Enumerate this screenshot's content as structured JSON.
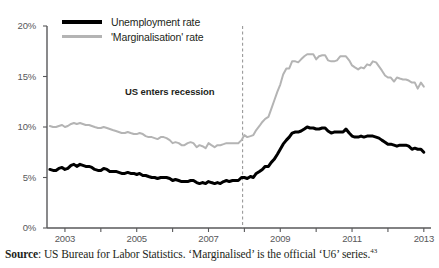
{
  "chart_data": {
    "type": "line",
    "title": "",
    "xlabel": "",
    "ylabel": "",
    "xlim": [
      2002.5,
      2013.2
    ],
    "ylim": [
      0,
      20
    ],
    "grid": false,
    "legend_position": "top-left",
    "y_tick_labels": [
      "20%",
      "15%",
      "10%",
      "5%",
      "0%"
    ],
    "y_tick_values": [
      20,
      15,
      10,
      5,
      0
    ],
    "x_tick_labels": [
      "2003",
      "2005",
      "2007",
      "2009",
      "2011",
      "2013"
    ],
    "x_tick_values": [
      2003,
      2005,
      2007,
      2009,
      2011,
      2013
    ],
    "annotations": [
      {
        "text": "US enters recession",
        "x": 2007.95,
        "type": "vertical-dashed-line"
      }
    ],
    "series": [
      {
        "name": "Unemployment rate",
        "color": "#000000",
        "width": 3,
        "x": [
          2002.58,
          2002.67,
          2002.75,
          2002.83,
          2002.92,
          2003.0,
          2003.08,
          2003.17,
          2003.25,
          2003.33,
          2003.42,
          2003.5,
          2003.58,
          2003.67,
          2003.75,
          2003.83,
          2003.92,
          2004.0,
          2004.08,
          2004.17,
          2004.25,
          2004.33,
          2004.42,
          2004.5,
          2004.58,
          2004.67,
          2004.75,
          2004.83,
          2004.92,
          2005.0,
          2005.08,
          2005.17,
          2005.25,
          2005.33,
          2005.42,
          2005.5,
          2005.58,
          2005.67,
          2005.75,
          2005.83,
          2005.92,
          2006.0,
          2006.08,
          2006.17,
          2006.25,
          2006.33,
          2006.42,
          2006.5,
          2006.58,
          2006.67,
          2006.75,
          2006.83,
          2006.92,
          2007.0,
          2007.08,
          2007.17,
          2007.25,
          2007.33,
          2007.42,
          2007.5,
          2007.58,
          2007.67,
          2007.75,
          2007.83,
          2007.92,
          2008.0,
          2008.08,
          2008.17,
          2008.25,
          2008.33,
          2008.42,
          2008.5,
          2008.58,
          2008.67,
          2008.75,
          2008.83,
          2008.92,
          2009.0,
          2009.08,
          2009.17,
          2009.25,
          2009.33,
          2009.42,
          2009.5,
          2009.58,
          2009.67,
          2009.75,
          2009.83,
          2009.92,
          2010.0,
          2010.08,
          2010.17,
          2010.25,
          2010.33,
          2010.42,
          2010.5,
          2010.58,
          2010.67,
          2010.75,
          2010.83,
          2010.92,
          2011.0,
          2011.08,
          2011.17,
          2011.25,
          2011.33,
          2011.42,
          2011.5,
          2011.58,
          2011.67,
          2011.75,
          2011.83,
          2011.92,
          2012.0,
          2012.08,
          2012.17,
          2012.25,
          2012.33,
          2012.42,
          2012.5,
          2012.58,
          2012.67,
          2012.75,
          2012.83,
          2012.92,
          2013.0
        ],
        "values": [
          5.8,
          5.7,
          5.7,
          5.9,
          6.0,
          5.8,
          5.9,
          6.2,
          6.3,
          6.1,
          6.3,
          6.2,
          6.1,
          6.1,
          6.0,
          5.8,
          5.7,
          5.7,
          5.9,
          5.8,
          5.6,
          5.6,
          5.6,
          5.5,
          5.4,
          5.4,
          5.5,
          5.4,
          5.4,
          5.3,
          5.4,
          5.2,
          5.2,
          5.1,
          5.0,
          5.0,
          4.9,
          5.0,
          5.0,
          5.0,
          4.9,
          4.7,
          4.8,
          4.7,
          4.6,
          4.6,
          4.6,
          4.7,
          4.7,
          4.5,
          4.4,
          4.5,
          4.4,
          4.6,
          4.5,
          4.4,
          4.5,
          4.4,
          4.6,
          4.7,
          4.6,
          4.7,
          4.7,
          4.7,
          5.0,
          5.0,
          4.9,
          5.1,
          5.0,
          5.4,
          5.6,
          5.8,
          6.1,
          6.1,
          6.5,
          6.8,
          7.3,
          7.8,
          8.3,
          8.7,
          9.0,
          9.4,
          9.5,
          9.5,
          9.6,
          9.8,
          10.0,
          9.9,
          9.9,
          9.8,
          9.8,
          9.9,
          9.9,
          9.6,
          9.4,
          9.5,
          9.5,
          9.5,
          9.5,
          9.8,
          9.4,
          9.1,
          9.0,
          9.0,
          9.1,
          9.0,
          9.1,
          9.1,
          9.1,
          9.0,
          8.9,
          8.7,
          8.5,
          8.3,
          8.3,
          8.2,
          8.1,
          8.2,
          8.2,
          8.2,
          8.1,
          7.8,
          7.9,
          7.8,
          7.8,
          7.5
        ]
      },
      {
        "name": "'Marginalisation' rate",
        "color": "#b4b4b4",
        "width": 2,
        "x": [
          2002.58,
          2002.67,
          2002.75,
          2002.83,
          2002.92,
          2003.0,
          2003.08,
          2003.17,
          2003.25,
          2003.33,
          2003.42,
          2003.5,
          2003.58,
          2003.67,
          2003.75,
          2003.83,
          2003.92,
          2004.0,
          2004.08,
          2004.17,
          2004.25,
          2004.33,
          2004.42,
          2004.5,
          2004.58,
          2004.67,
          2004.75,
          2004.83,
          2004.92,
          2005.0,
          2005.08,
          2005.17,
          2005.25,
          2005.33,
          2005.42,
          2005.5,
          2005.58,
          2005.67,
          2005.75,
          2005.83,
          2005.92,
          2006.0,
          2006.08,
          2006.17,
          2006.25,
          2006.33,
          2006.42,
          2006.5,
          2006.58,
          2006.67,
          2006.75,
          2006.83,
          2006.92,
          2007.0,
          2007.08,
          2007.17,
          2007.25,
          2007.33,
          2007.42,
          2007.5,
          2007.58,
          2007.67,
          2007.75,
          2007.83,
          2007.92,
          2008.0,
          2008.08,
          2008.17,
          2008.25,
          2008.33,
          2008.42,
          2008.5,
          2008.58,
          2008.67,
          2008.75,
          2008.83,
          2008.92,
          2009.0,
          2009.08,
          2009.17,
          2009.25,
          2009.33,
          2009.42,
          2009.5,
          2009.58,
          2009.67,
          2009.75,
          2009.83,
          2009.92,
          2010.0,
          2010.08,
          2010.17,
          2010.25,
          2010.33,
          2010.42,
          2010.5,
          2010.58,
          2010.67,
          2010.75,
          2010.83,
          2010.92,
          2011.0,
          2011.08,
          2011.17,
          2011.25,
          2011.33,
          2011.42,
          2011.5,
          2011.58,
          2011.67,
          2011.75,
          2011.83,
          2011.92,
          2012.0,
          2012.08,
          2012.17,
          2012.25,
          2012.33,
          2012.42,
          2012.5,
          2012.58,
          2012.67,
          2012.75,
          2012.83,
          2012.92,
          2013.0
        ],
        "values": [
          10.1,
          10.0,
          10.0,
          10.1,
          10.2,
          10.0,
          10.1,
          10.3,
          10.4,
          10.3,
          10.4,
          10.3,
          10.2,
          10.2,
          10.1,
          10.0,
          9.9,
          9.9,
          10.0,
          9.9,
          9.8,
          9.7,
          9.6,
          9.5,
          9.4,
          9.4,
          9.5,
          9.4,
          9.3,
          9.3,
          9.4,
          9.3,
          9.1,
          9.0,
          9.0,
          8.9,
          8.8,
          9.0,
          9.0,
          8.9,
          8.7,
          8.4,
          8.5,
          8.4,
          8.2,
          8.2,
          8.4,
          8.5,
          8.4,
          8.0,
          8.2,
          8.1,
          7.9,
          8.4,
          8.2,
          8.0,
          8.2,
          8.2,
          8.3,
          8.4,
          8.4,
          8.4,
          8.4,
          8.4,
          8.7,
          9.2,
          9.0,
          9.1,
          9.2,
          9.7,
          10.1,
          10.5,
          10.8,
          11.0,
          11.8,
          12.6,
          13.5,
          14.2,
          15.2,
          15.8,
          15.8,
          16.5,
          16.5,
          16.4,
          16.7,
          17.0,
          17.2,
          17.2,
          17.2,
          16.7,
          17.0,
          17.1,
          17.1,
          16.6,
          16.5,
          16.5,
          16.6,
          17.0,
          17.0,
          17.0,
          16.6,
          16.1,
          15.9,
          15.7,
          15.9,
          15.8,
          16.2,
          16.1,
          16.5,
          16.4,
          16.0,
          15.6,
          15.1,
          14.9,
          14.9,
          14.5,
          14.9,
          14.8,
          14.7,
          14.7,
          14.6,
          14.4,
          14.4,
          13.8,
          14.4,
          14.0
        ]
      }
    ]
  },
  "legend": {
    "items": [
      {
        "label": "Unemployment rate",
        "color": "#000000",
        "style": "thick-black-line"
      },
      {
        "label": "'Marginalisation' rate",
        "color": "#b4b4b4",
        "style": "thin-grey-line"
      }
    ]
  },
  "annotation": {
    "recession_label": "US enters recession"
  },
  "axes": {
    "y_labels": [
      "20%",
      "15%",
      "10%",
      "5%",
      "0%"
    ],
    "x_labels": [
      "2003",
      "2005",
      "2007",
      "2009",
      "2011",
      "2013"
    ]
  },
  "source": {
    "prefix": "Source",
    "text": ": US Bureau for Labor Statistics. ‘Marginalised’ is the official ‘U6’ series.",
    "footnote": "43"
  }
}
